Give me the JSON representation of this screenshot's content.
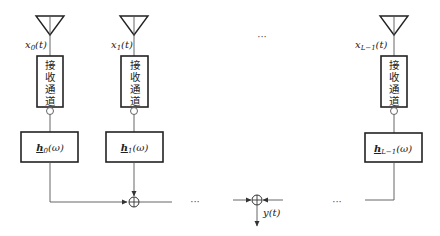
{
  "diagram": {
    "type": "array beamformer block diagram",
    "channels": [
      {
        "antenna_label": "x",
        "antenna_subscript": "0",
        "antenna_suffix": "(t)",
        "receiver_label": [
          "接",
          "收",
          "通",
          "道"
        ],
        "filter_label": "h",
        "filter_subscript": "0",
        "filter_suffix": "(ω)"
      },
      {
        "antenna_label": "x",
        "antenna_subscript": "1",
        "antenna_suffix": "(t)",
        "receiver_label": [
          "接",
          "收",
          "通",
          "道"
        ],
        "filter_label": "h",
        "filter_subscript": "1",
        "filter_suffix": "(ω)"
      },
      {
        "antenna_label": "x",
        "antenna_subscript": "L−1",
        "antenna_suffix": "(t)",
        "receiver_label": [
          "接",
          "收",
          "通",
          "道"
        ],
        "filter_label": "h",
        "filter_subscript": "L−1",
        "filter_suffix": "(ω)"
      }
    ],
    "ellipsis": "···",
    "output_label": "y(t)"
  }
}
